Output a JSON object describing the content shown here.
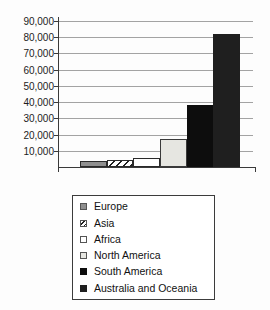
{
  "chart_data": {
    "type": "bar",
    "title": "",
    "xlabel": "",
    "ylabel": "",
    "categories": [
      "Europe",
      "Asia",
      "Africa",
      "North America",
      "South America",
      "Australia and Oceania"
    ],
    "values": [
      4000,
      4500,
      5500,
      17000,
      38000,
      82000
    ],
    "ylim": [
      0,
      90000
    ],
    "ytick_interval": 10000,
    "ytick_labels": [
      "10,000",
      "20,000",
      "30,000",
      "40,000",
      "50,000",
      "60,000",
      "70,000",
      "80,000",
      "90,000"
    ],
    "grid": true,
    "gridline_color": "#a3a3a3",
    "axis_color": "#3a3a3a",
    "legend_position": "bottom",
    "series_styles": [
      {
        "name": "Europe",
        "pattern": "solid",
        "fill": "#8f8f8f",
        "border": "#2a2a2a"
      },
      {
        "name": "Asia",
        "pattern": "diagonal-hatch",
        "fill": "#ffffff",
        "hatch_color": "#222222",
        "border": "#2a2a2a"
      },
      {
        "name": "Africa",
        "pattern": "solid",
        "fill": "#ffffff",
        "border": "#2a2a2a"
      },
      {
        "name": "North America",
        "pattern": "solid",
        "fill": "#e6e6e1",
        "border": "#3a3a3a"
      },
      {
        "name": "South America",
        "pattern": "solid",
        "fill": "#0d0d0d",
        "border": "#0d0d0d"
      },
      {
        "name": "Australia and Oceania",
        "pattern": "solid",
        "fill": "#1f1f1f",
        "border": "#1f1f1f"
      }
    ]
  }
}
